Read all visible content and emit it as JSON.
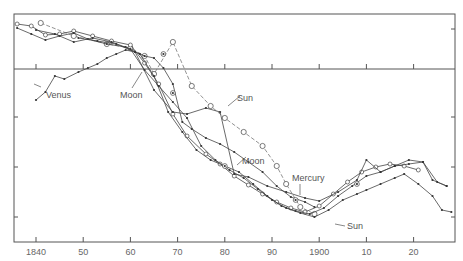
{
  "chart_data": {
    "type": "line",
    "title": "",
    "xlabel": "",
    "ylabel": "",
    "xlim": [
      1835.4,
      1928
    ],
    "ylim": [
      0,
      228
    ],
    "x_ticks": [
      1840,
      1850,
      1860,
      1870,
      1880,
      1890,
      1900,
      1910,
      1920
    ],
    "x_tick_labels": [
      "1840",
      "50",
      "60",
      "70",
      "80",
      "90",
      "1900",
      "10",
      "20"
    ],
    "y_ticks_unlabeled": 4,
    "grid": false,
    "zero_line_y_px": 69,
    "annotations": [
      {
        "text": "Venus",
        "x_px": 46,
        "y_px": 98
      },
      {
        "text": "Moon",
        "x_px": 120,
        "y_px": 98
      },
      {
        "text": "Sun",
        "x_px": 237,
        "y_px": 101
      },
      {
        "text": "Moon",
        "x_px": 242,
        "y_px": 164
      },
      {
        "text": "Mercury",
        "x_px": 292,
        "y_px": 181
      },
      {
        "text": "Sun",
        "x_px": 347,
        "y_px": 229
      }
    ],
    "series": [
      {
        "name": "Sun (dashed, circles)",
        "style": "dashed-open-circle",
        "points": [
          [
            1841,
            9
          ],
          [
            1848,
            22
          ],
          [
            1855,
            30
          ],
          [
            1860,
            34
          ],
          [
            1863,
            42
          ],
          [
            1865,
            60
          ],
          [
            1869,
            28
          ],
          [
            1873,
            72
          ],
          [
            1877,
            92
          ],
          [
            1880,
            104
          ],
          [
            1884,
            118
          ],
          [
            1888,
            132
          ],
          [
            1891,
            152
          ],
          [
            1893,
            170
          ],
          [
            1896,
            193
          ],
          [
            1899,
            200
          ]
        ]
      },
      {
        "name": "Venus",
        "style": "solid-dot",
        "points": [
          [
            1840,
            86
          ],
          [
            1842,
            78
          ],
          [
            1844,
            62
          ],
          [
            1846,
            65
          ],
          [
            1849,
            58
          ],
          [
            1851,
            54
          ],
          [
            1853,
            50
          ],
          [
            1855,
            44
          ],
          [
            1857,
            40
          ],
          [
            1859,
            36
          ],
          [
            1861,
            38
          ],
          [
            1863,
            42
          ],
          [
            1865,
            44
          ],
          [
            1867,
            54
          ],
          [
            1869,
            70
          ],
          [
            1871,
            108
          ],
          [
            1873,
            115
          ],
          [
            1876,
            124
          ],
          [
            1879,
            130
          ],
          [
            1882,
            138
          ],
          [
            1885,
            148
          ],
          [
            1888,
            158
          ],
          [
            1891,
            172
          ],
          [
            1894,
            183
          ],
          [
            1897,
            188
          ],
          [
            1899,
            193
          ]
        ]
      },
      {
        "name": "Moon (open circles)",
        "style": "solid-open-circle",
        "points": [
          [
            1836,
            10
          ],
          [
            1839,
            12
          ],
          [
            1842,
            21
          ],
          [
            1845,
            20
          ],
          [
            1848,
            17
          ],
          [
            1852,
            22
          ],
          [
            1856,
            27
          ],
          [
            1860,
            31
          ],
          [
            1863,
            49
          ],
          [
            1866,
            70
          ],
          [
            1869,
            100
          ],
          [
            1872,
            122
          ],
          [
            1876,
            140
          ],
          [
            1879,
            150
          ],
          [
            1882,
            162
          ],
          [
            1885,
            171
          ],
          [
            1888,
            180
          ],
          [
            1891,
            188
          ],
          [
            1894,
            194
          ],
          [
            1897,
            198
          ],
          [
            1900,
            192
          ],
          [
            1903,
            180
          ],
          [
            1906,
            168
          ],
          [
            1909,
            158
          ],
          [
            1912,
            153
          ],
          [
            1915,
            150
          ],
          [
            1918,
            152
          ],
          [
            1921,
            156
          ]
        ]
      },
      {
        "name": "Mercury",
        "style": "solid-dot",
        "points": [
          [
            1836,
            14
          ],
          [
            1839,
            20
          ],
          [
            1842,
            26
          ],
          [
            1845,
            22
          ],
          [
            1848,
            19
          ],
          [
            1851,
            25
          ],
          [
            1855,
            30
          ],
          [
            1859,
            33
          ],
          [
            1862,
            40
          ],
          [
            1865,
            62
          ],
          [
            1868,
            98
          ],
          [
            1871,
            118
          ],
          [
            1874,
            136
          ],
          [
            1877,
            146
          ],
          [
            1880,
            152
          ],
          [
            1883,
            158
          ],
          [
            1886,
            170
          ],
          [
            1889,
            182
          ],
          [
            1892,
            192
          ],
          [
            1895,
            197
          ],
          [
            1898,
            200
          ],
          [
            1901,
            194
          ],
          [
            1904,
            182
          ],
          [
            1907,
            172
          ],
          [
            1910,
            162
          ],
          [
            1913,
            158
          ],
          [
            1916,
            152
          ],
          [
            1919,
            146
          ],
          [
            1922,
            148
          ],
          [
            1924,
            166
          ],
          [
            1927,
            172
          ]
        ]
      },
      {
        "name": "Sun (lower, dots)",
        "style": "solid-dot",
        "points": [
          [
            1840,
            16
          ],
          [
            1844,
            20
          ],
          [
            1848,
            28
          ],
          [
            1852,
            24
          ],
          [
            1856,
            28
          ],
          [
            1860,
            35
          ],
          [
            1863,
            56
          ],
          [
            1866,
            72
          ],
          [
            1869,
            88
          ],
          [
            1872,
            104
          ],
          [
            1875,
            132
          ],
          [
            1878,
            146
          ],
          [
            1881,
            156
          ],
          [
            1884,
            164
          ],
          [
            1887,
            175
          ],
          [
            1890,
            186
          ],
          [
            1893,
            194
          ],
          [
            1896,
            199
          ],
          [
            1899,
            203
          ],
          [
            1902,
            196
          ],
          [
            1905,
            186
          ],
          [
            1908,
            180
          ],
          [
            1910,
            176
          ],
          [
            1913,
            170
          ],
          [
            1916,
            164
          ],
          [
            1918,
            160
          ],
          [
            1921,
            170
          ],
          [
            1924,
            182
          ],
          [
            1926,
            196
          ],
          [
            1928,
            198
          ]
        ]
      },
      {
        "name": "Venus (upper segment)",
        "style": "solid-dot",
        "points": [
          [
            1849,
            24
          ],
          [
            1853,
            27
          ],
          [
            1857,
            30
          ],
          [
            1861,
            38
          ],
          [
            1865,
            76
          ],
          [
            1869,
            98
          ],
          [
            1872,
            100
          ],
          [
            1876,
            94
          ],
          [
            1879,
            98
          ],
          [
            1882,
            160
          ],
          [
            1885,
            163
          ],
          [
            1889,
            172
          ],
          [
            1893,
            178
          ],
          [
            1897,
            184
          ],
          [
            1900,
            187
          ],
          [
            1904,
            178
          ],
          [
            1908,
            166
          ],
          [
            1910,
            146
          ],
          [
            1913,
            158
          ],
          [
            1916,
            152
          ],
          [
            1919,
            150
          ],
          [
            1922,
            148
          ],
          [
            1925,
            168
          ],
          [
            1927,
            172
          ]
        ]
      }
    ],
    "special_markers": [
      {
        "label": "Moon-marker",
        "x": 1867,
        "y": 40
      },
      {
        "label": "Moon-marker",
        "x": 1869,
        "y": 79
      },
      {
        "label": "Moon-marker",
        "x": 1880,
        "y": 152
      },
      {
        "label": "Mercury-marker",
        "x": 1895,
        "y": 186
      },
      {
        "label": "Sun-marker",
        "x": 1908,
        "y": 170
      }
    ]
  }
}
